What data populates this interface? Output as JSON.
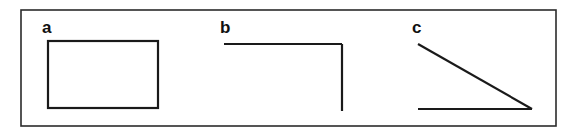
{
  "figure": {
    "background_color": "#ffffff",
    "line_color": "#1a1a1a",
    "frame_color": "#2b2b2b",
    "frame": {
      "x": 21,
      "y": 10,
      "width": 535,
      "height": 116
    },
    "panels": [
      {
        "id": "a",
        "label": "a",
        "label_x": 42,
        "label_y": 33,
        "shape_type": "closed-rectangle",
        "description": "closed rectangle outline",
        "rect": {
          "x": 48,
          "y": 41,
          "width": 110,
          "height": 67
        }
      },
      {
        "id": "b",
        "label": "b",
        "label_x": 220,
        "label_y": 33,
        "shape_type": "open-corner",
        "description": "horizontal segment and vertical segment meeting at top-right corner",
        "segments": [
          {
            "x1": 224,
            "y1": 44,
            "x2": 342,
            "y2": 44
          },
          {
            "x1": 342,
            "y1": 44,
            "x2": 342,
            "y2": 111
          }
        ]
      },
      {
        "id": "c",
        "label": "c",
        "label_x": 412,
        "label_y": 33,
        "shape_type": "open-acute-angle",
        "description": "diagonal segment and horizontal segment meeting at bottom-right vertex",
        "segments": [
          {
            "x1": 418,
            "y1": 44,
            "x2": 532,
            "y2": 109
          },
          {
            "x1": 418,
            "y1": 109,
            "x2": 532,
            "y2": 109
          }
        ]
      }
    ]
  }
}
